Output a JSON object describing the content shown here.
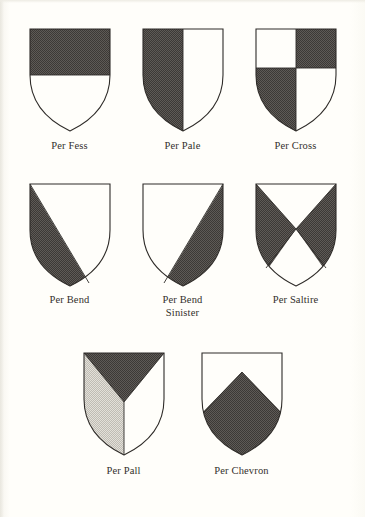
{
  "page": {
    "background_color": "#fffefa",
    "ink_color": "#332f2c"
  },
  "palette": {
    "tincture_dark": "#4a4643",
    "tincture_light_gray": "#cfccc5",
    "tincture_white": "#fffefa",
    "outline": "#2e2b28"
  },
  "rows": [
    {
      "shields": [
        {
          "name": "per-fess",
          "caption": "Per Fess",
          "division": "horizontal",
          "fills": [
            "dark",
            "white"
          ]
        },
        {
          "name": "per-pale",
          "caption": "Per Pale",
          "division": "vertical",
          "fills": [
            "dark",
            "white"
          ]
        },
        {
          "name": "per-cross",
          "caption": "Per Cross",
          "division": "quarterly",
          "fills": [
            "white",
            "dark",
            "dark",
            "white"
          ]
        }
      ]
    },
    {
      "shields": [
        {
          "name": "per-bend",
          "caption": "Per Bend",
          "division": "diagonal-dexter",
          "fills": [
            "white",
            "dark"
          ]
        },
        {
          "name": "per-bend-sinister",
          "caption": "Per Bend\nSinister",
          "division": "diagonal-sinister",
          "fills": [
            "white",
            "dark"
          ]
        },
        {
          "name": "per-saltire",
          "caption": "Per Saltire",
          "division": "saltire",
          "fills": [
            "white",
            "dark",
            "dark",
            "white"
          ]
        }
      ]
    },
    {
      "shields": [
        {
          "name": "per-pall",
          "caption": "Per Pall",
          "division": "pall",
          "fills": [
            "dark",
            "light-gray",
            "white"
          ]
        },
        {
          "name": "per-chevron",
          "caption": "Per Chevron",
          "division": "chevron",
          "fills": [
            "white",
            "dark"
          ]
        }
      ]
    }
  ]
}
